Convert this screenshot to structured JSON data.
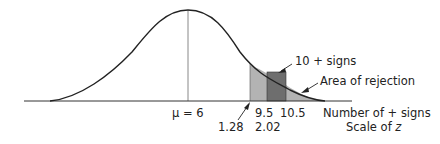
{
  "diagram": {
    "mean_label": "μ = 6",
    "x_ticks_signs": [
      "9.5",
      "10.5"
    ],
    "x_ticks_z": [
      "1.28",
      "2.02"
    ],
    "axis_label_signs": "Number of + signs",
    "axis_label_z_prefix": "Scale of ",
    "axis_label_z_var": "z",
    "annotation_bar": "10 + signs",
    "annotation_rejection": "Area of rejection",
    "colors": {
      "curve": "#222222",
      "baseline": "#333333",
      "mean_line": "#888888",
      "rejection_fill": "#b3b3b3",
      "bar_fill": "#6e6e6e"
    }
  }
}
